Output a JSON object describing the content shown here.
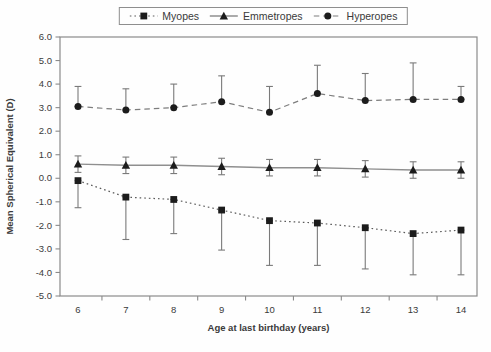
{
  "colors": {
    "marker": "#1c1c1c",
    "myopes_line": "#5a5a5a",
    "emmetropes_line": "#8f8f8f",
    "hyperopes_line": "#7d7d7d",
    "error_bar": "#7a7a7a",
    "frame": "#8a8a8a",
    "text": "#3a3a3a"
  },
  "chart_data": {
    "type": "line",
    "title": "",
    "xlabel": "Age at last birthday (years)",
    "ylabel": "Mean Spherical Equivalent (D)",
    "x": [
      6,
      7,
      8,
      9,
      10,
      11,
      12,
      13,
      14
    ],
    "xtick_labels": [
      "6",
      "7",
      "8",
      "9",
      "10",
      "11",
      "12",
      "13",
      "14"
    ],
    "ytick_labels": [
      "6.0",
      "5.0",
      "4.0",
      "3.0",
      "2.0",
      "1.0",
      "0.0",
      "-1.0",
      "-2.0",
      "-3.0",
      "-4.0",
      "-5.0"
    ],
    "ylim": [
      -5.0,
      6.0
    ],
    "grid": false,
    "legend_position": "top-center",
    "series": [
      {
        "name": "Myopes",
        "marker": "square",
        "line": "dotted",
        "values": [
          -0.1,
          -0.8,
          -0.9,
          -1.35,
          -1.8,
          -1.9,
          -2.1,
          -2.35,
          -2.2
        ],
        "error_low": [
          -1.25,
          -2.6,
          -2.35,
          -3.05,
          -3.7,
          -3.7,
          -3.85,
          -4.1,
          -4.1
        ],
        "error_high": [
          -0.1,
          -0.8,
          -0.9,
          -1.35,
          -1.8,
          -1.9,
          -2.1,
          -2.35,
          -2.2
        ]
      },
      {
        "name": "Emmetropes",
        "marker": "triangle",
        "line": "solid",
        "values": [
          0.6,
          0.55,
          0.55,
          0.5,
          0.45,
          0.45,
          0.4,
          0.35,
          0.35
        ],
        "error_low": [
          0.25,
          0.2,
          0.2,
          0.15,
          0.1,
          0.1,
          0.05,
          0.0,
          0.0
        ],
        "error_high": [
          0.95,
          0.9,
          0.9,
          0.85,
          0.8,
          0.8,
          0.75,
          0.7,
          0.7
        ]
      },
      {
        "name": "Hyperopes",
        "marker": "circle",
        "line": "dashed",
        "values": [
          3.05,
          2.9,
          3.0,
          3.25,
          2.8,
          3.6,
          3.3,
          3.35,
          3.35
        ],
        "error_low": [
          3.05,
          2.9,
          3.0,
          3.25,
          2.8,
          3.6,
          3.3,
          3.35,
          3.35
        ],
        "error_high": [
          3.9,
          3.8,
          4.0,
          4.35,
          3.9,
          4.8,
          4.45,
          4.9,
          3.9
        ]
      }
    ]
  }
}
